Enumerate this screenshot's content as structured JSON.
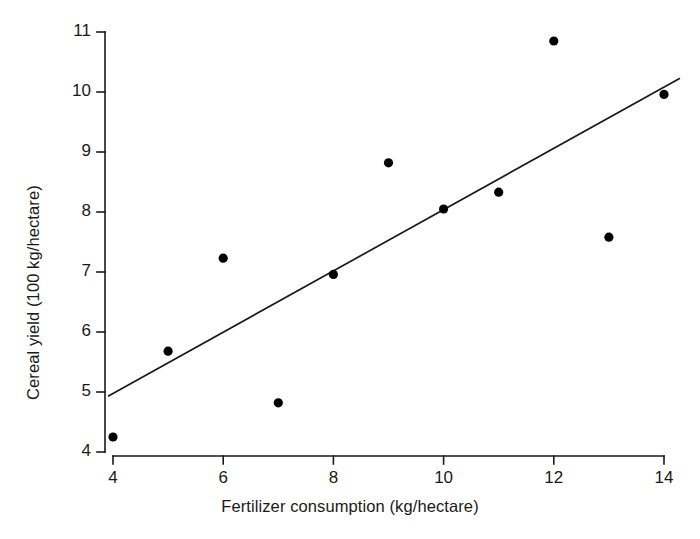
{
  "chart_data": {
    "type": "scatter",
    "title": "",
    "xlabel": "Fertilizer consumption (kg/hectare)",
    "ylabel": "Cereal yield (100 kg/hectare)",
    "xlim": [
      3.6,
      14.6
    ],
    "ylim": [
      3.6,
      11.2
    ],
    "xticks": [
      4,
      6,
      8,
      10,
      12,
      14
    ],
    "yticks": [
      4,
      5,
      6,
      7,
      8,
      9,
      10,
      11
    ],
    "xtick_labels": [
      "4",
      "6",
      "8",
      "10",
      "12",
      "14"
    ],
    "ytick_labels": [
      "4",
      "5",
      "6",
      "7",
      "8",
      "9",
      "10",
      "11"
    ],
    "grid": false,
    "legend": false,
    "marker": "filled-circle",
    "marker_color": "#000000",
    "line_color": "#1a1a1a",
    "x": [
      4,
      5,
      6,
      7,
      8,
      9,
      10,
      11,
      12,
      13,
      14
    ],
    "y": [
      4.25,
      5.68,
      7.23,
      4.82,
      6.96,
      8.82,
      8.05,
      8.33,
      10.85,
      7.58,
      9.96
    ],
    "points": [
      {
        "x": 4,
        "y": 4.25
      },
      {
        "x": 5,
        "y": 5.68
      },
      {
        "x": 6,
        "y": 7.23
      },
      {
        "x": 7,
        "y": 4.82
      },
      {
        "x": 8,
        "y": 6.96
      },
      {
        "x": 9,
        "y": 8.82
      },
      {
        "x": 10,
        "y": 8.05
      },
      {
        "x": 11,
        "y": 8.33
      },
      {
        "x": 12,
        "y": 10.85
      },
      {
        "x": 13,
        "y": 7.58
      },
      {
        "x": 14,
        "y": 9.96
      }
    ],
    "trendline": {
      "type": "linear-regression",
      "x_start": 3.91,
      "y_start": 4.93,
      "x_end": 14.29,
      "y_end": 10.23,
      "slope": 0.511,
      "intercept": 2.94
    }
  },
  "axes": {
    "x_axis_label": "Fertilizer consumption (kg/hectare)",
    "y_axis_label": "Cereal yield (100 kg/hectare)"
  }
}
